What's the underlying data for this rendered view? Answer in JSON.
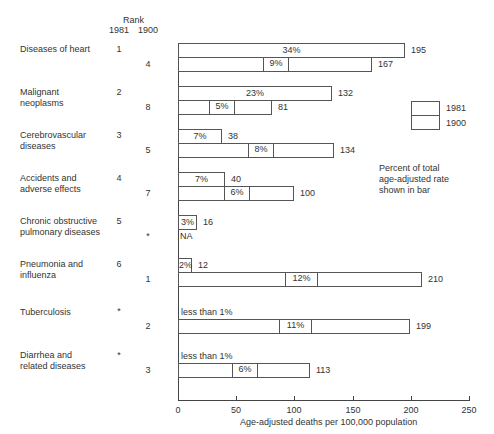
{
  "header": {
    "rank_label": "Rank",
    "rank_1981": "1981",
    "rank_1900": "1900"
  },
  "legend": {
    "label_1981": "1981",
    "label_1900": "1900",
    "note": "Percent of total\nage-adjusted rate\nshown in bar"
  },
  "axis": {
    "xlabel": "Age-adjusted deaths per 100,000 population",
    "ticks": [
      "0",
      "50",
      "100",
      "150",
      "200",
      "250"
    ]
  },
  "rows": [
    {
      "label": "Diseases of heart",
      "rank1981": "1",
      "rank1900": "4",
      "v1981": 195,
      "p1981": "34%",
      "v1900": 167,
      "p1900": "9%",
      "t1981": "195",
      "t1900": "167"
    },
    {
      "label": "Malignant\nneoplasms",
      "rank1981": "2",
      "rank1900": "8",
      "v1981": 132,
      "p1981": "23%",
      "v1900": 81,
      "p1900": "5%",
      "t1981": "132",
      "t1900": "81"
    },
    {
      "label": "Cerebrovascular\ndiseases",
      "rank1981": "3",
      "rank1900": "5",
      "v1981": 38,
      "p1981": "7%",
      "v1900": 134,
      "p1900": "8%",
      "t1981": "38",
      "t1900": "134"
    },
    {
      "label": "Accidents and\nadverse effects",
      "rank1981": "4",
      "rank1900": "7",
      "v1981": 40,
      "p1981": "7%",
      "v1900": 100,
      "p1900": "6%",
      "t1981": "40",
      "t1900": "100"
    },
    {
      "label": "Chronic obstructive\npulmonary diseases",
      "rank1981": "5",
      "rank1900": "*",
      "v1981": 16,
      "p1981": "3%",
      "v1900": null,
      "p1900": "NA",
      "t1981": "16",
      "t1900": ""
    },
    {
      "label": "Pneumonia and\ninfluenza",
      "rank1981": "6",
      "rank1900": "1",
      "v1981": 12,
      "p1981": "2%",
      "v1900": 210,
      "p1900": "12%",
      "t1981": "12",
      "t1900": "210"
    },
    {
      "label": "Tuberculosis",
      "rank1981": "*",
      "rank1900": "2",
      "v1981": null,
      "p1981": "less than 1%",
      "v1900": 199,
      "p1900": "11%",
      "t1981": "",
      "t1900": "199"
    },
    {
      "label": "Diarrhea and\nrelated diseases",
      "rank1981": "*",
      "rank1900": "3",
      "v1981": null,
      "p1981": "less than 1%",
      "v1900": 113,
      "p1900": "6%",
      "t1981": "",
      "t1900": "113"
    }
  ],
  "chart_data": {
    "type": "bar",
    "title": "",
    "xlabel": "Age-adjusted deaths per 100,000 population",
    "ylabel": "",
    "xlim": [
      0,
      250
    ],
    "orientation": "horizontal",
    "categories": [
      "Diseases of heart",
      "Malignant neoplasms",
      "Cerebrovascular diseases",
      "Accidents and adverse effects",
      "Chronic obstructive pulmonary diseases",
      "Pneumonia and influenza",
      "Tuberculosis",
      "Diarrhea and related diseases"
    ],
    "series": [
      {
        "name": "1981",
        "values": [
          195,
          132,
          38,
          40,
          16,
          12,
          null,
          null
        ],
        "percent_labels": [
          "34%",
          "23%",
          "7%",
          "7%",
          "3%",
          "2%",
          "less than 1%",
          "less than 1%"
        ],
        "rank": [
          "1",
          "2",
          "3",
          "4",
          "5",
          "6",
          "*",
          "*"
        ]
      },
      {
        "name": "1900",
        "values": [
          167,
          81,
          134,
          100,
          null,
          210,
          199,
          113
        ],
        "percent_labels": [
          "9%",
          "5%",
          "8%",
          "6%",
          "NA",
          "12%",
          "11%",
          "6%"
        ],
        "rank": [
          "4",
          "8",
          "5",
          "7",
          "*",
          "1",
          "2",
          "3"
        ]
      }
    ],
    "legend": [
      "1981",
      "1900"
    ],
    "annotation": "Percent of total age-adjusted rate shown in bar",
    "grid": false
  }
}
